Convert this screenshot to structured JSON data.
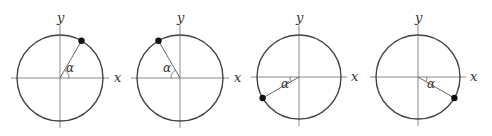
{
  "figure": {
    "width": 492,
    "height": 136,
    "colors": {
      "circle": "#444444",
      "axis": "#8a8a8a",
      "point": "#111111"
    },
    "panels": [
      {
        "id": "p1",
        "cx": 60,
        "cy": 78,
        "r": 43,
        "angle_deg": 60,
        "alpha_ref": "pos-x",
        "x_label": "x",
        "y_label": "y",
        "angle_label": "α",
        "x_label_pos": [
          114,
          82
        ],
        "y_label_pos": [
          57,
          22
        ],
        "alpha_pos": [
          66,
          72
        ]
      },
      {
        "id": "p2",
        "cx": 180,
        "cy": 78,
        "r": 43,
        "angle_deg": 120,
        "alpha_ref": "neg-x",
        "x_label": "x",
        "y_label": "y",
        "angle_label": "α",
        "x_label_pos": [
          234,
          82
        ],
        "y_label_pos": [
          177,
          22
        ],
        "alpha_pos": [
          163,
          72
        ]
      },
      {
        "id": "p3",
        "cx": 299,
        "cy": 77,
        "r": 42,
        "angle_deg": 210,
        "alpha_ref": "neg-x",
        "x_label": "x",
        "y_label": "y",
        "angle_label": "α",
        "x_label_pos": [
          351,
          81
        ],
        "y_label_pos": [
          296,
          22
        ],
        "alpha_pos": [
          281,
          88
        ]
      },
      {
        "id": "p4",
        "cx": 418,
        "cy": 77,
        "r": 42,
        "angle_deg": 330,
        "alpha_ref": "pos-x",
        "x_label": "x",
        "y_label": "y",
        "angle_label": "α",
        "x_label_pos": [
          470,
          81
        ],
        "y_label_pos": [
          415,
          22
        ],
        "alpha_pos": [
          427,
          88
        ]
      }
    ]
  }
}
